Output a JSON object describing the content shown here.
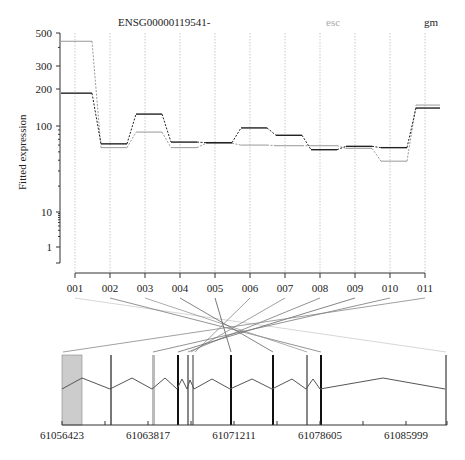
{
  "chart_data": {
    "type": "line",
    "title": "ENSG00000119541-",
    "ylabel": "Fitted expression",
    "xlabel": "",
    "yscale": "log",
    "ylim": [
      0.5,
      500
    ],
    "yticks": [
      "500",
      "300",
      "200",
      "100",
      "10",
      "1"
    ],
    "categories": [
      "001",
      "002",
      "003",
      "004",
      "005",
      "006",
      "007",
      "008",
      "009",
      "010",
      "011"
    ],
    "legend": [
      {
        "name": "esc",
        "color": "#aaaaaa"
      },
      {
        "name": "gm",
        "color": "#222222"
      }
    ],
    "series": [
      {
        "name": "gm",
        "color": "#222222",
        "values": [
          185,
          62,
          125,
          65,
          64,
          95,
          78,
          53,
          58,
          56,
          140
        ]
      },
      {
        "name": "esc",
        "color": "#999999",
        "values": [
          440,
          56,
          85,
          56,
          63,
          60,
          59,
          59,
          55,
          39,
          148
        ]
      }
    ],
    "gene_structure": {
      "axis_ticks": [
        "61056423",
        "61063817",
        "61071211",
        "61078605",
        "61085999"
      ],
      "exons": [
        {
          "x": 62,
          "w": 20,
          "fill": "#cccccc"
        },
        {
          "x": 110,
          "w": 2,
          "fill": "#777777"
        },
        {
          "x": 152,
          "w": 3,
          "fill": "#bbbbbb"
        },
        {
          "x": 177,
          "w": 2,
          "fill": "#111111"
        },
        {
          "x": 187,
          "w": 2,
          "fill": "#888888"
        },
        {
          "x": 192,
          "w": 2,
          "fill": "#999999"
        },
        {
          "x": 230,
          "w": 2,
          "fill": "#111111"
        },
        {
          "x": 272,
          "w": 2,
          "fill": "#111111"
        },
        {
          "x": 306,
          "w": 2,
          "fill": "#888888"
        },
        {
          "x": 320,
          "w": 2,
          "fill": "#111111"
        },
        {
          "x": 445,
          "w": 2,
          "fill": "#888888"
        }
      ]
    }
  }
}
